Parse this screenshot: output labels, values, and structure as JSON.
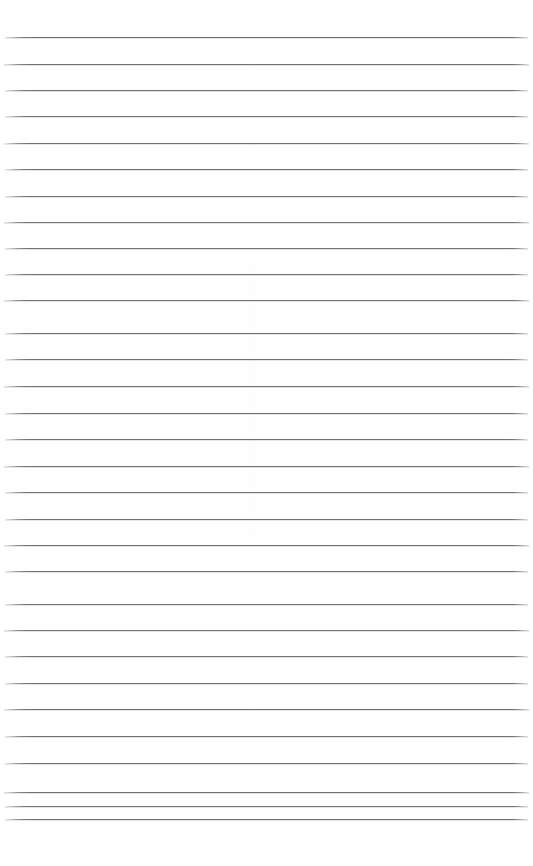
{
  "document": {
    "kind": "ruled-notebook-page",
    "title": "Blank lined paper page",
    "content_text": "",
    "page_width": 533,
    "page_height": 866,
    "background_color": "#ffffff",
    "rule_color": "#6e7277",
    "rule_thickness": 1,
    "rule_count": 31,
    "first_rule_y": 37,
    "rule_spacing": 26.07,
    "rule_left_x": 5,
    "rule_right_x": 528,
    "top_margin": 37,
    "bottom_margin": 47,
    "left_margin": 5,
    "right_margin": 5,
    "has_vertical_margin_rule": false,
    "has_header_text": false,
    "has_handwriting": false,
    "scan_seam_x": 253,
    "rules": [
      {
        "index": 1,
        "y": 37,
        "left": 5,
        "right": 528
      },
      {
        "index": 2,
        "y": 64,
        "left": 4,
        "right": 529
      },
      {
        "index": 3,
        "y": 90,
        "left": 5,
        "right": 528
      },
      {
        "index": 4,
        "y": 116,
        "left": 5,
        "right": 528
      },
      {
        "index": 5,
        "y": 143,
        "left": 4,
        "right": 529
      },
      {
        "index": 6,
        "y": 169,
        "left": 5,
        "right": 528
      },
      {
        "index": 7,
        "y": 196,
        "left": 5,
        "right": 528
      },
      {
        "index": 8,
        "y": 222,
        "left": 4,
        "right": 529
      },
      {
        "index": 9,
        "y": 248,
        "left": 5,
        "right": 528
      },
      {
        "index": 10,
        "y": 274,
        "left": 5,
        "right": 528
      },
      {
        "index": 11,
        "y": 300,
        "left": 4,
        "right": 529
      },
      {
        "index": 12,
        "y": 333,
        "left": 5,
        "right": 528
      },
      {
        "index": 13,
        "y": 359,
        "left": 5,
        "right": 528
      },
      {
        "index": 14,
        "y": 386,
        "left": 4,
        "right": 529
      },
      {
        "index": 15,
        "y": 413,
        "left": 5,
        "right": 528
      },
      {
        "index": 16,
        "y": 439,
        "left": 5,
        "right": 528
      },
      {
        "index": 17,
        "y": 466,
        "left": 4,
        "right": 529
      },
      {
        "index": 18,
        "y": 492,
        "left": 5,
        "right": 528
      },
      {
        "index": 19,
        "y": 519,
        "left": 5,
        "right": 528
      },
      {
        "index": 20,
        "y": 545,
        "left": 4,
        "right": 529
      },
      {
        "index": 21,
        "y": 571,
        "left": 5,
        "right": 528
      },
      {
        "index": 22,
        "y": 604,
        "left": 5,
        "right": 528
      },
      {
        "index": 23,
        "y": 630,
        "left": 4,
        "right": 529
      },
      {
        "index": 24,
        "y": 656,
        "left": 5,
        "right": 528
      },
      {
        "index": 25,
        "y": 683,
        "left": 5,
        "right": 528
      },
      {
        "index": 26,
        "y": 709,
        "left": 4,
        "right": 529
      },
      {
        "index": 27,
        "y": 736,
        "left": 5,
        "right": 528
      },
      {
        "index": 28,
        "y": 763,
        "left": 5,
        "right": 528
      },
      {
        "index": 29,
        "y": 792,
        "left": 4,
        "right": 529
      },
      {
        "index": 30,
        "y": 806,
        "left": 5,
        "right": 528
      },
      {
        "index": 31,
        "y": 819,
        "left": 5,
        "right": 528
      }
    ]
  }
}
